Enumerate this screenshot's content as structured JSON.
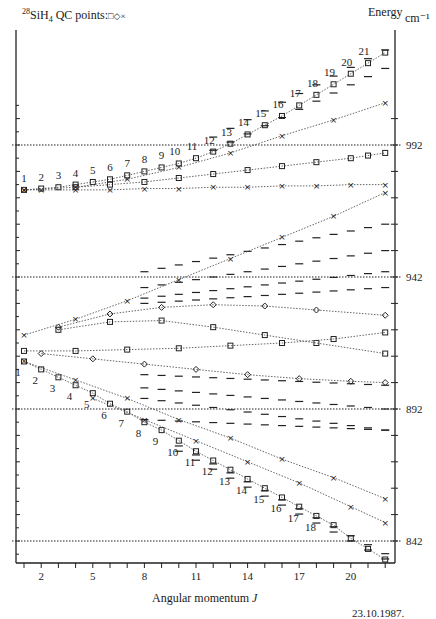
{
  "header": {
    "isotope": "28",
    "molecule_base": "SiH",
    "molecule_sub": "4",
    "points_label": "QC points:",
    "legend_symbols": "□◇×"
  },
  "axis": {
    "energy_label": "Energy",
    "unit_label": "cm⁻¹",
    "xlabel_text": "Angular momentum ",
    "xlabel_var": "J",
    "date": "23.10.1987."
  },
  "chart_data": {
    "type": "scatter",
    "xlabel": "Angular momentum J",
    "ylabel": "Energy cm-1",
    "xlim": [
      1,
      22
    ],
    "ylim": [
      834,
      1008
    ],
    "x_ticks": [
      2,
      5,
      8,
      11,
      14,
      17,
      20
    ],
    "y_ticks": [
      842,
      892,
      942,
      992
    ],
    "reference_lines": [
      842,
      892,
      942,
      992
    ],
    "series": [
      {
        "name": "upper-band-square",
        "marker": "square",
        "J": [
          1,
          2,
          3,
          4,
          5,
          6,
          7,
          8,
          9,
          10,
          11,
          12,
          13,
          14,
          15,
          16,
          17,
          18,
          19,
          20,
          21,
          22
        ],
        "values": [
          975,
          975.5,
          976,
          977,
          978,
          979,
          980.5,
          982,
          983.5,
          985,
          987,
          989.5,
          992.5,
          996,
          999.5,
          1003,
          1007,
          1011,
          1015,
          1019,
          1023,
          1027
        ]
      },
      {
        "name": "upper-band-square-2",
        "marker": "square",
        "J": [
          4,
          6,
          8,
          10,
          12,
          14,
          16,
          18,
          20,
          21,
          22
        ],
        "values": [
          976,
          977,
          978,
          979.5,
          981,
          982.5,
          984,
          985.5,
          987,
          988,
          989
        ]
      },
      {
        "name": "upper-band-cross-flat",
        "marker": "cross",
        "J": [
          1,
          2,
          4,
          6,
          8,
          10,
          12,
          14,
          16,
          18,
          20,
          22
        ],
        "values": [
          975,
          975,
          975,
          975,
          975.5,
          975.5,
          976,
          976,
          976.5,
          976.5,
          977,
          977
        ]
      },
      {
        "name": "upper-band-cross-rising",
        "marker": "cross",
        "J": [
          1,
          4,
          7,
          10,
          13,
          16,
          19,
          22
        ],
        "values": [
          975,
          976,
          979,
          983.5,
          989,
          995.5,
          1001.5,
          1008
        ]
      },
      {
        "name": "mid-cross-rising",
        "marker": "cross",
        "J": [
          1,
          4,
          7,
          10,
          13,
          16,
          19,
          22
        ],
        "values": [
          920,
          926,
          933,
          941,
          949,
          957,
          965,
          974
        ]
      },
      {
        "name": "mid-diamond-upper",
        "marker": "diamond",
        "J": [
          3,
          6,
          9,
          12,
          15,
          18,
          22
        ],
        "values": [
          923,
          928,
          930.5,
          931.5,
          931,
          929.5,
          927.5
        ]
      },
      {
        "name": "mid-square-curve",
        "marker": "square",
        "J": [
          3,
          6,
          9,
          12,
          15,
          18,
          22
        ],
        "values": [
          922,
          925,
          925.5,
          923,
          920,
          917,
          913
        ]
      },
      {
        "name": "mid-square-flat",
        "marker": "square",
        "J": [
          1,
          4,
          7,
          10,
          13,
          16,
          19,
          22
        ],
        "values": [
          914,
          914,
          914.5,
          915,
          916,
          917,
          918.5,
          921
        ]
      },
      {
        "name": "mid-diamond-lower",
        "marker": "diamond",
        "J": [
          2,
          5,
          8,
          11,
          14,
          17,
          20,
          22
        ],
        "values": [
          913,
          911,
          909,
          907,
          905,
          903.5,
          902.5,
          902
        ]
      },
      {
        "name": "lower-cross-fast",
        "marker": "cross",
        "J": [
          1,
          4,
          7,
          10,
          13,
          16,
          19,
          22
        ],
        "values": [
          910,
          903,
          896,
          888,
          881,
          873,
          866,
          858
        ]
      },
      {
        "name": "lower-band-square",
        "marker": "square",
        "J": [
          1,
          2,
          3,
          4,
          5,
          6,
          7,
          8,
          9,
          10,
          11,
          12,
          13,
          14,
          15,
          16,
          17,
          18,
          19,
          20,
          21,
          22
        ],
        "values": [
          910,
          907,
          904,
          901,
          898,
          894,
          891,
          887,
          884,
          880,
          876,
          872.5,
          869,
          865.5,
          862,
          858.5,
          855,
          851.5,
          848,
          843,
          839,
          835
        ]
      },
      {
        "name": "lower-cross-slow",
        "marker": "cross",
        "J": [
          5,
          8,
          11,
          14,
          17,
          20,
          22
        ],
        "values": [
          896,
          888,
          880,
          872,
          864,
          855,
          849
        ]
      }
    ],
    "upper_labels": {
      "J": [
        1,
        2,
        3,
        4,
        5,
        6,
        7,
        8,
        9,
        10,
        11,
        12,
        13,
        14,
        15,
        16,
        17,
        18,
        19,
        20,
        21
      ],
      "text": [
        "1",
        "2",
        "3",
        "4",
        "5",
        "6",
        "7",
        "8",
        "9",
        "10",
        "11",
        "12",
        "13",
        "14",
        "15",
        "16",
        "17",
        "18",
        "19",
        "20",
        "21"
      ]
    },
    "lower_labels": {
      "J": [
        1,
        2,
        3,
        4,
        5,
        6,
        7,
        8,
        9,
        10,
        11,
        12,
        13,
        14,
        15,
        16,
        17,
        18
      ],
      "text": [
        "1",
        "2",
        "3",
        "4",
        "5",
        "6",
        "7",
        "8",
        "9",
        "10",
        "11",
        "12",
        "13",
        "14",
        "15",
        "16",
        "17",
        "18"
      ]
    }
  },
  "plot": {
    "px_x0": 24,
    "px_per_J": 17.2,
    "px_y_992": 145,
    "px_per_cm": 2.64,
    "left_axis_x": 16,
    "right_axis_x": 395,
    "top_y": 30,
    "bottom_y": 563,
    "line_color": "#555555",
    "marker_color": "#222222",
    "dash_color": "#333333"
  }
}
